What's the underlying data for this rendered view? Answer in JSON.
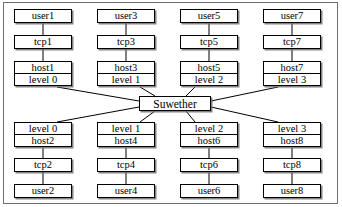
{
  "diagram": {
    "hub": {
      "label": "Suwether",
      "x": 139,
      "y": 96,
      "w": 72,
      "h": 15
    },
    "colors": {
      "stroke": "#000000",
      "frame": "#6f6f6f",
      "shadow": "#6e6e6e",
      "background": "#ffffff"
    },
    "columns": [
      {
        "x": 14,
        "w": 58,
        "top": {
          "user": "user1",
          "tcp": "tcp1",
          "host": "host1",
          "level": "level 0"
        },
        "bottom": {
          "level": "level 0",
          "host": "host2",
          "tcp": "tcp2",
          "user": "user2"
        }
      },
      {
        "x": 97,
        "w": 58,
        "top": {
          "user": "user3",
          "tcp": "tcp3",
          "host": "host3",
          "level": "level 1"
        },
        "bottom": {
          "level": "level 1",
          "host": "host4",
          "tcp": "tcp4",
          "user": "user4"
        }
      },
      {
        "x": 180,
        "w": 58,
        "top": {
          "user": "user5",
          "tcp": "tcp5",
          "host": "host5",
          "level": "level 2"
        },
        "bottom": {
          "level": "level 2",
          "host": "host6",
          "tcp": "tcp6",
          "user": "user6"
        }
      },
      {
        "x": 263,
        "w": 58,
        "top": {
          "user": "user7",
          "tcp": "tcp7",
          "host": "host7",
          "level": "level 3"
        },
        "bottom": {
          "level": "level 3",
          "host": "host8",
          "tcp": "tcp8",
          "user": "user8"
        }
      }
    ],
    "rows": {
      "top_user_y": 9,
      "top_tcp_y": 35,
      "top_stack_y": 61,
      "bottom_stack_y": 122,
      "bottom_tcp_y": 158,
      "bottom_user_y": 184,
      "box_h": 14,
      "cell_h": 13
    }
  }
}
